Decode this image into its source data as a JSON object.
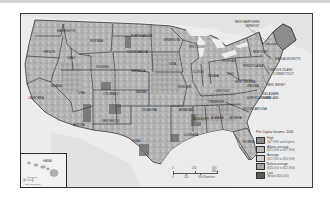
{
  "map": {
    "title": "Per Capita Income, 2000",
    "type": "choropleth",
    "region": "United States (counties)",
    "state_labels": [
      {
        "name": "Washington",
        "x": 36,
        "y": 17
      },
      {
        "name": "Oregon",
        "x": 22,
        "y": 38
      },
      {
        "name": "California",
        "x": 7,
        "y": 84
      },
      {
        "name": "Nevada",
        "x": 30,
        "y": 72
      },
      {
        "name": "Idaho",
        "x": 46,
        "y": 44
      },
      {
        "name": "Montana",
        "x": 69,
        "y": 27
      },
      {
        "name": "Wyoming",
        "x": 75,
        "y": 53
      },
      {
        "name": "Utah",
        "x": 57,
        "y": 79
      },
      {
        "name": "Arizona",
        "x": 52,
        "y": 111
      },
      {
        "name": "Colorado",
        "x": 82,
        "y": 80
      },
      {
        "name": "New Mexico",
        "x": 81,
        "y": 107
      },
      {
        "name": "North Dakota",
        "x": 110,
        "y": 22
      },
      {
        "name": "South Dakota",
        "x": 106,
        "y": 38
      },
      {
        "name": "Nebraska",
        "x": 110,
        "y": 57
      },
      {
        "name": "Kansas",
        "x": 115,
        "y": 78
      },
      {
        "name": "Oklahoma",
        "x": 121,
        "y": 96
      },
      {
        "name": "Texas",
        "x": 111,
        "y": 127
      },
      {
        "name": "Minnesota",
        "x": 143,
        "y": 26
      },
      {
        "name": "Iowa",
        "x": 148,
        "y": 50
      },
      {
        "name": "Missouri",
        "x": 157,
        "y": 73
      },
      {
        "name": "Arkansas",
        "x": 158,
        "y": 96
      },
      {
        "name": "Louisiana",
        "x": 163,
        "y": 121
      },
      {
        "name": "Wisconsin",
        "x": 168,
        "y": 33
      },
      {
        "name": "Illinois",
        "x": 172,
        "y": 58
      },
      {
        "name": "Michigan",
        "x": 201,
        "y": 47
      },
      {
        "name": "Indiana",
        "x": 187,
        "y": 62
      },
      {
        "name": "Ohio",
        "x": 206,
        "y": 60
      },
      {
        "name": "Kentucky",
        "x": 195,
        "y": 77
      },
      {
        "name": "Tennessee",
        "x": 187,
        "y": 88
      },
      {
        "name": "Mississippi",
        "x": 172,
        "y": 105
      },
      {
        "name": "Alabama",
        "x": 190,
        "y": 104
      },
      {
        "name": "Georgia",
        "x": 208,
        "y": 104
      },
      {
        "name": "Florida",
        "x": 222,
        "y": 128
      },
      {
        "name": "South Carolina",
        "x": 222,
        "y": 95
      },
      {
        "name": "North Carolina",
        "x": 226,
        "y": 84
      },
      {
        "name": "Virginia",
        "x": 226,
        "y": 72
      },
      {
        "name": "West Virginia",
        "x": 214,
        "y": 68
      },
      {
        "name": "Pennsylvania",
        "x": 222,
        "y": 52
      },
      {
        "name": "New York",
        "x": 232,
        "y": 38
      }
    ],
    "callout_labels": [
      {
        "name": "New Hampshire",
        "x": 224,
        "y": 10
      },
      {
        "name": "Vermont",
        "x": 230,
        "y": 14
      },
      {
        "name": "Massachusetts",
        "x": 254,
        "y": 45
      },
      {
        "name": "Rhode Island",
        "x": 252,
        "y": 56
      },
      {
        "name": "Connecticut",
        "x": 254,
        "y": 60
      },
      {
        "name": "New Jersey",
        "x": 247,
        "y": 70
      },
      {
        "name": "Delaware",
        "x": 244,
        "y": 80
      },
      {
        "name": "Maryland",
        "x": 244,
        "y": 84
      }
    ],
    "inset": {
      "label": "Hawaii",
      "scale_miles": "100 Miles",
      "scale_km": "100 Kilometers"
    },
    "scale_bar": {
      "miles_ticks": [
        "0",
        "250",
        "500 Miles"
      ],
      "km_ticks": [
        "0",
        "250",
        "500 Kilometers"
      ]
    }
  },
  "legend": {
    "title": "Per Capita Income, 2000",
    "items": [
      {
        "label": "High",
        "range": "($27,996 and higher)",
        "color": "#8a8a8a"
      },
      {
        "label": "Above average",
        "range": "($25,996 to $27,994)",
        "color": "#b8b8b8"
      },
      {
        "label": "Average",
        "range": "($22,996 to $25,994)",
        "color": "#cfcfcf"
      },
      {
        "label": "Below average",
        "range": "($16,000 to $22,994)",
        "color": "#a3a3a3"
      },
      {
        "label": "Low",
        "range": "(Below $16,000)",
        "color": "#5a5a5a"
      }
    ]
  },
  "colors": {
    "water": "#ebebeb",
    "land_base": "#b4b4b4",
    "border": "#1e1e1e",
    "frame": "#3a3a3a"
  }
}
